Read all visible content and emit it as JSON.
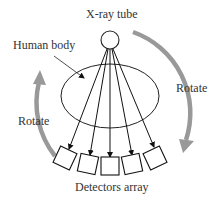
{
  "labels": {
    "xray_tube": "X-ray tube",
    "human_body": "Human body",
    "rotate_right": "Rotate",
    "rotate_left": "Rotate",
    "detectors": "Detectors array"
  },
  "colors": {
    "line": "#111111",
    "arrow_arc": "#999999",
    "text": "#333333"
  },
  "counts": {
    "detectors": 5,
    "beams": 5
  }
}
